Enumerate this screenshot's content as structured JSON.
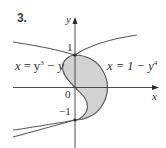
{
  "problem": {
    "number": "3."
  },
  "axes": {
    "x_label": "x",
    "y_label": "y",
    "tick_labels": {
      "one": "1",
      "zero": "0",
      "neg_one": "−1"
    }
  },
  "curves": [
    {
      "label_var": "x",
      "label_eq": " = y",
      "label_exp": "3",
      "label_rest": " − y",
      "equation": "x = y^3 − y"
    },
    {
      "label_var": "x",
      "label_eq": " = 1 − y",
      "label_exp": "4",
      "label_rest": "",
      "equation": "x = 1 − y^4"
    }
  ],
  "colors": {
    "curve": "#5a5a5a",
    "axis": "#3a3a3a",
    "shade": "#cfcfcf",
    "text": "#2b2b2b"
  },
  "diagram": {
    "type": "region-between-curves",
    "shaded_region": "between x = y^3 − y and x = 1 − y^4 for −1 ≤ y ≤ 1",
    "intersections": [
      [
        0,
        1
      ],
      [
        0,
        -1
      ]
    ]
  }
}
